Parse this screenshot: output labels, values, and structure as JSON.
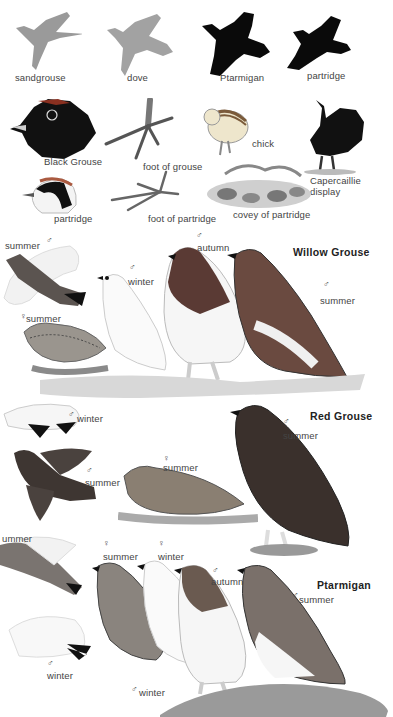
{
  "silhouettes": [
    {
      "label": "sandgrouse",
      "shade": "#9a9a9a"
    },
    {
      "label": "dove",
      "shade": "#a0a0a0"
    },
    {
      "label": "Ptarmigan",
      "shade": "#0a0a0a"
    },
    {
      "label": "partridge",
      "shade": "#0a0a0a"
    }
  ],
  "details": {
    "black_grouse": "Black Grouse",
    "foot_of_grouse": "foot of grouse",
    "chick": "chick",
    "capercaillie": "Capercaillie",
    "capercaillie_2": "display",
    "partridge": "partridge",
    "foot_of_partridge": "foot of partridge",
    "covey": "covey of partridge"
  },
  "willow_grouse": {
    "title": "Willow Grouse",
    "labels": {
      "male_summer_flight": "summer",
      "male_winter": "winter",
      "male_autumn": "autumn",
      "male_summer": "summer",
      "female_summer": "summer",
      "male_winter_flight": "winter"
    }
  },
  "red_grouse": {
    "title": "Red Grouse",
    "labels": {
      "male_summer": "summer",
      "male_summer_flight": "summer",
      "female_summer": "summer"
    }
  },
  "ptarmigan": {
    "title": "Ptarmigan",
    "labels": {
      "summer_flight": "ummer",
      "female_summer": "summer",
      "female_winter": "winter",
      "male_autumn": "autumn",
      "male_summer": "summer",
      "winter_flight": "winter",
      "male_winter": "winter"
    }
  },
  "symbols": {
    "male": "♂",
    "female": "♀"
  }
}
